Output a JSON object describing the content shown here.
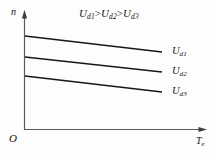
{
  "figure": {
    "kind": "mechanical-characteristic-curves",
    "width": 215,
    "height": 158,
    "background_color": "#fdfdfd",
    "line_color": "#1a1a1a",
    "axis_color": "#555555"
  },
  "annotation": {
    "title_symbol_1": "U",
    "title_sub_1": "d1",
    "title_op_1": ">",
    "title_symbol_2": "U",
    "title_sub_2": "d2",
    "title_op_2": ">",
    "title_symbol_3": "U",
    "title_sub_3": "d3",
    "title_plain": "Ud1>Ud2>Ud3"
  },
  "axes": {
    "y_label": "n",
    "x_symbol": "T",
    "x_sub": "e",
    "x_label_plain": "Te",
    "origin_label": "O",
    "y_axis_x": 24,
    "y_axis_top": 12,
    "x_axis_y": 130,
    "x_axis_right": 207,
    "arrows": true,
    "grid": false,
    "ticks": false
  },
  "chart_data": {
    "type": "line",
    "title": "Ud1>Ud2>Ud3",
    "xlabel": "Te",
    "ylabel": "n",
    "xlim": [
      0,
      207
    ],
    "ylim": [
      0,
      130
    ],
    "grid": false,
    "legend_position": "right-inline",
    "series": [
      {
        "name": "Ud1",
        "label_symbol": "U",
        "label_sub": "d1",
        "x": [
          25,
          162
        ],
        "y": [
          36,
          52
        ],
        "label_x": 172,
        "label_y": 52
      },
      {
        "name": "Ud2",
        "label_symbol": "U",
        "label_sub": "d2",
        "x": [
          25,
          162
        ],
        "y": [
          57,
          72
        ],
        "label_x": 172,
        "label_y": 72
      },
      {
        "name": "Ud3",
        "label_symbol": "U",
        "label_sub": "d3",
        "x": [
          25,
          162
        ],
        "y": [
          76,
          92
        ],
        "label_x": 172,
        "label_y": 92
      }
    ]
  }
}
